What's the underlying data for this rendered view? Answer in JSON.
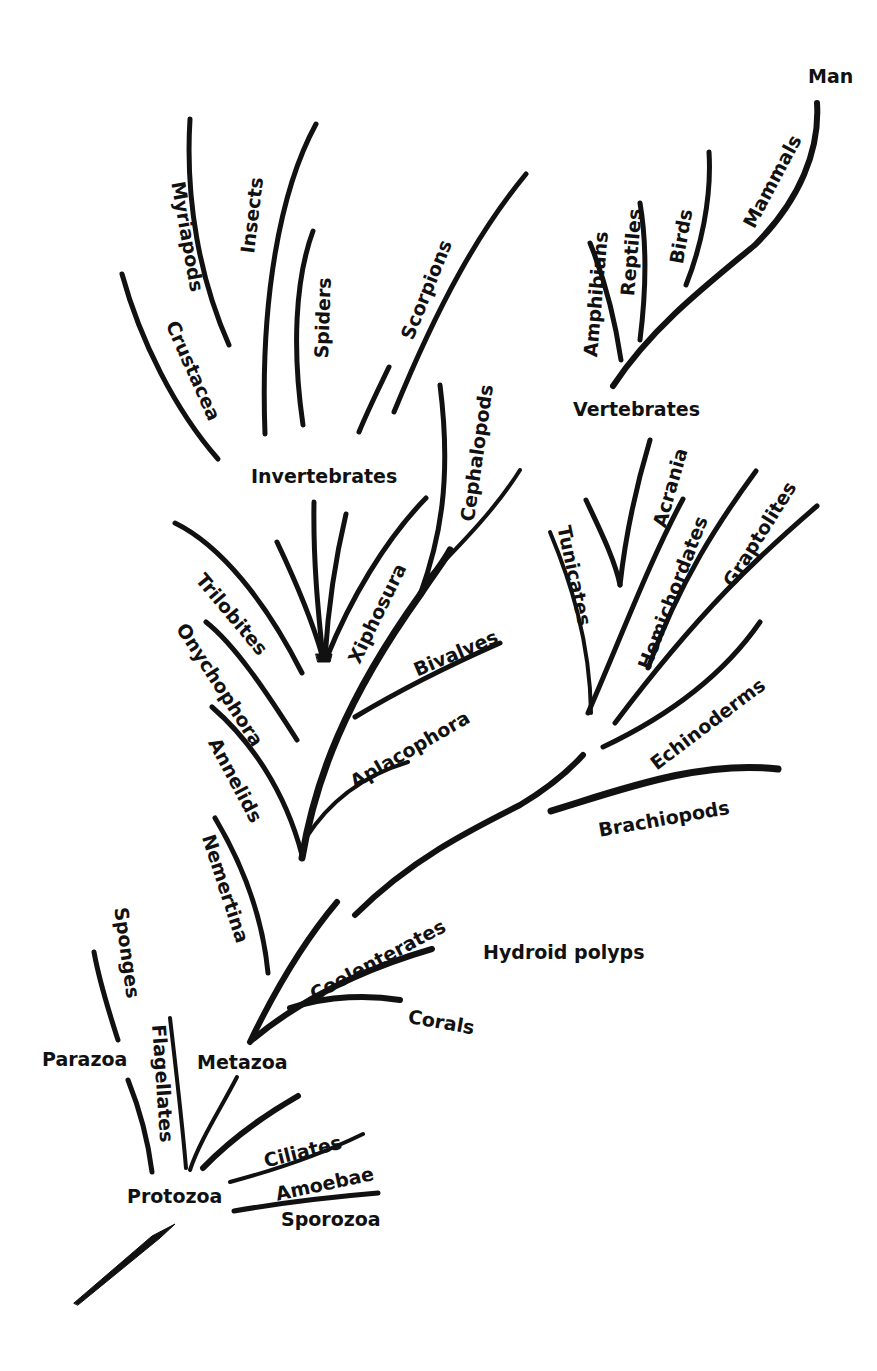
{
  "diagram": {
    "type": "phylogenetic-tree",
    "ink_color": "#111111",
    "background_color": "#ffffff"
  },
  "labels": {
    "man": "Man",
    "mammals": "Mammals",
    "birds": "Birds",
    "reptiles": "Reptiles",
    "amphibians": "Amphibians",
    "vertebrates": "Vertebrates",
    "myriapods": "Myriapods",
    "insects": "Insects",
    "spiders": "Spiders",
    "scorpions": "Scorpions",
    "crustacea": "Crustacea",
    "invertebrates": "Invertebrates",
    "cephalopods": "Cephalopods",
    "xiphosura": "Xiphosura",
    "trilobites": "Trilobites",
    "onychophora": "Onychophora",
    "bivalves": "Bivalves",
    "aplacophora": "Aplacophora",
    "annelids": "Annelids",
    "nemertina": "Nemertina",
    "acrania": "Acrania",
    "hemichordates": "Hemichordates",
    "graptolites": "Graptolites",
    "tunicates": "Tunicates",
    "echinoderms": "Echinoderms",
    "brachiopods": "Brachiopods",
    "coelenterates": "Coelenterates",
    "hydroid_polyps": "Hydroid polyps",
    "corals": "Corals",
    "sponges": "Sponges",
    "parazoa": "Parazoa",
    "flagellates": "Flagellates",
    "metazoa": "Metazoa",
    "ciliates": "Ciliates",
    "amoebae": "Amoebae",
    "protozoa": "Protozoa",
    "sporozoa": "Sporozoa"
  }
}
